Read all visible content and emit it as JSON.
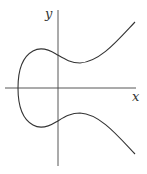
{
  "diagram": {
    "title": "",
    "type": "elliptic-curve-plot",
    "axes": {
      "x_label": "x",
      "y_label": "y"
    },
    "colors": {
      "curve": "#333333",
      "axis": "#444444",
      "background": "#ffffff"
    }
  }
}
